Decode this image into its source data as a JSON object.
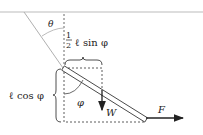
{
  "diagram": {
    "labels": {
      "theta": "θ",
      "half": "1",
      "half_den": "2",
      "sin_expr": "ℓ sin φ",
      "cos_expr": "ℓ cos φ",
      "phi": "φ",
      "weight": "W",
      "force": "F"
    },
    "colors": {
      "line": "#222222",
      "ceiling": "#bbbbbb",
      "string": "#b0b0b0"
    }
  }
}
